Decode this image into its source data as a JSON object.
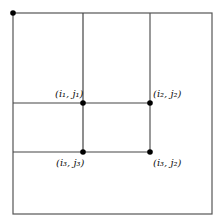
{
  "diagram": {
    "type": "grid-partition",
    "outer_box": {
      "x1": 13,
      "y1": 13,
      "x2": 212,
      "y2": 214
    },
    "vertical_lines": [
      {
        "x": 83,
        "y1": 13,
        "y2": 152
      },
      {
        "x": 150,
        "y1": 13,
        "y2": 152
      }
    ],
    "horizontal_lines": [
      {
        "y": 103,
        "x1": 13,
        "x2": 150
      },
      {
        "y": 152,
        "x1": 13,
        "x2": 150
      }
    ],
    "points": [
      {
        "name": "origin",
        "x": 13,
        "y": 13,
        "label": ""
      },
      {
        "name": "p1",
        "x": 83,
        "y": 103,
        "label": "(i₁, j₁)"
      },
      {
        "name": "p2",
        "x": 150,
        "y": 103,
        "label": "(i₂, j₂)"
      },
      {
        "name": "p3",
        "x": 83,
        "y": 152,
        "label": "(i₃, j₃)"
      },
      {
        "name": "p4",
        "x": 150,
        "y": 152,
        "label": "(i₃, j₂)"
      }
    ],
    "colors": {
      "line": "#555555",
      "dot": "#000000"
    }
  }
}
